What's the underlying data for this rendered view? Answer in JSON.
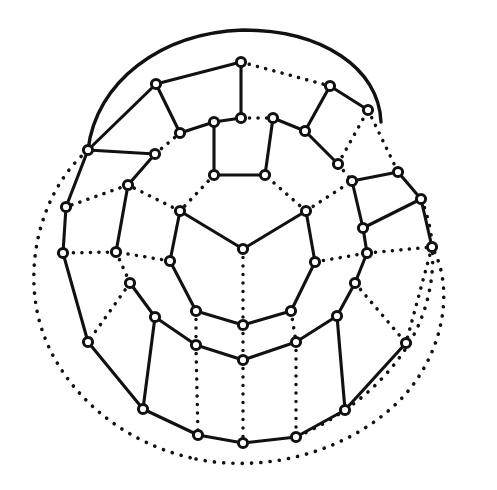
{
  "figure": {
    "type": "graph-diagram",
    "width": 497,
    "height": 490,
    "background_color": "#ffffff",
    "ink_color": "#111111",
    "node_radius": 4.6,
    "node_count": 45,
    "solid_edge_count": 47,
    "dotted_edge_count": 29
  },
  "nodes": [
    {
      "id": "c0",
      "ring": 0,
      "x": 243,
      "y": 249
    },
    {
      "id": "r1a",
      "ring": 1,
      "x": 180,
      "y": 211
    },
    {
      "id": "r1b",
      "ring": 1,
      "x": 170,
      "y": 261
    },
    {
      "id": "r1c",
      "ring": 1,
      "x": 196,
      "y": 311
    },
    {
      "id": "r1d",
      "ring": 1,
      "x": 243,
      "y": 325
    },
    {
      "id": "r1e",
      "ring": 1,
      "x": 291,
      "y": 311
    },
    {
      "id": "r1f",
      "ring": 1,
      "x": 315,
      "y": 262
    },
    {
      "id": "r1g",
      "ring": 1,
      "x": 306,
      "y": 211
    },
    {
      "id": "r1h",
      "ring": 1,
      "x": 265,
      "y": 175
    },
    {
      "id": "r1i",
      "ring": 1,
      "x": 214,
      "y": 175
    },
    {
      "id": "r2a",
      "ring": 2,
      "x": 214,
      "y": 122
    },
    {
      "id": "r2b",
      "ring": 2,
      "x": 241,
      "y": 118
    },
    {
      "id": "r2c",
      "ring": 2,
      "x": 273,
      "y": 118
    },
    {
      "id": "r2d",
      "ring": 2,
      "x": 305,
      "y": 131
    },
    {
      "id": "r2e",
      "ring": 2,
      "x": 338,
      "y": 164
    },
    {
      "id": "r2f",
      "ring": 2,
      "x": 352,
      "y": 181
    },
    {
      "id": "r2g",
      "ring": 2,
      "x": 363,
      "y": 228
    },
    {
      "id": "r2h",
      "ring": 2,
      "x": 367,
      "y": 253
    },
    {
      "id": "r2i",
      "ring": 2,
      "x": 355,
      "y": 283
    },
    {
      "id": "r2j",
      "ring": 2,
      "x": 337,
      "y": 316
    },
    {
      "id": "r2k",
      "ring": 2,
      "x": 296,
      "y": 342
    },
    {
      "id": "r2l",
      "ring": 2,
      "x": 243,
      "y": 360
    },
    {
      "id": "r2m",
      "ring": 2,
      "x": 196,
      "y": 345
    },
    {
      "id": "r2n",
      "ring": 2,
      "x": 155,
      "y": 317
    },
    {
      "id": "r2o",
      "ring": 2,
      "x": 130,
      "y": 283
    },
    {
      "id": "r2p",
      "ring": 2,
      "x": 116,
      "y": 252
    },
    {
      "id": "r2q",
      "ring": 2,
      "x": 128,
      "y": 185
    },
    {
      "id": "r2r",
      "ring": 2,
      "x": 155,
      "y": 154
    },
    {
      "id": "r2s",
      "ring": 2,
      "x": 180,
      "y": 133
    },
    {
      "id": "r3a",
      "ring": 3,
      "x": 156,
      "y": 84
    },
    {
      "id": "r3b",
      "ring": 3,
      "x": 241,
      "y": 62
    },
    {
      "id": "r3c",
      "ring": 3,
      "x": 330,
      "y": 86
    },
    {
      "id": "r3d",
      "ring": 3,
      "x": 368,
      "y": 110
    },
    {
      "id": "r3e",
      "ring": 3,
      "x": 398,
      "y": 172
    },
    {
      "id": "r3f",
      "ring": 3,
      "x": 421,
      "y": 199
    },
    {
      "id": "r3g",
      "ring": 3,
      "x": 432,
      "y": 247
    },
    {
      "id": "r3h",
      "ring": 3,
      "x": 406,
      "y": 343
    },
    {
      "id": "r3i",
      "ring": 3,
      "x": 345,
      "y": 410
    },
    {
      "id": "r3j",
      "ring": 3,
      "x": 296,
      "y": 437
    },
    {
      "id": "r3k",
      "ring": 3,
      "x": 243,
      "y": 443
    },
    {
      "id": "r3l",
      "ring": 3,
      "x": 198,
      "y": 435
    },
    {
      "id": "r3m",
      "ring": 3,
      "x": 143,
      "y": 409
    },
    {
      "id": "r3n",
      "ring": 3,
      "x": 88,
      "y": 342
    },
    {
      "id": "r3o",
      "ring": 3,
      "x": 63,
      "y": 253
    },
    {
      "id": "r3p",
      "ring": 3,
      "x": 66,
      "y": 207
    },
    {
      "id": "r3q",
      "ring": 3,
      "x": 88,
      "y": 150
    }
  ],
  "edges": [
    {
      "from": "c0",
      "to": "r1a",
      "style": "solid"
    },
    {
      "from": "c0",
      "to": "r1g",
      "style": "solid"
    },
    {
      "from": "c0",
      "to": "r1d",
      "style": "dotted"
    },
    {
      "from": "r1a",
      "to": "r1b",
      "style": "solid"
    },
    {
      "from": "r1b",
      "to": "r1c",
      "style": "solid"
    },
    {
      "from": "r1c",
      "to": "r1d",
      "style": "solid"
    },
    {
      "from": "r1d",
      "to": "r1e",
      "style": "solid"
    },
    {
      "from": "r1e",
      "to": "r1f",
      "style": "solid"
    },
    {
      "from": "r1f",
      "to": "r1g",
      "style": "solid"
    },
    {
      "from": "r1g",
      "to": "r1h",
      "style": "dotted"
    },
    {
      "from": "r1h",
      "to": "r1i",
      "style": "solid"
    },
    {
      "from": "r1i",
      "to": "r1a",
      "style": "dotted"
    },
    {
      "from": "r1i",
      "to": "r2a",
      "style": "solid"
    },
    {
      "from": "r1h",
      "to": "r2c",
      "style": "solid"
    },
    {
      "from": "r1b",
      "to": "r2p",
      "style": "dotted"
    },
    {
      "from": "r1c",
      "to": "r2m",
      "style": "dotted"
    },
    {
      "from": "r1e",
      "to": "r2k",
      "style": "dotted"
    },
    {
      "from": "r1f",
      "to": "r2h",
      "style": "dotted"
    },
    {
      "from": "r1a",
      "to": "r2q",
      "style": "dotted"
    },
    {
      "from": "r1g",
      "to": "r2f",
      "style": "dotted"
    },
    {
      "from": "r1d",
      "to": "r2l",
      "style": "dotted"
    },
    {
      "from": "r2a",
      "to": "r2b",
      "style": "solid"
    },
    {
      "from": "r2b",
      "to": "r2c",
      "style": "dotted"
    },
    {
      "from": "r2c",
      "to": "r2d",
      "style": "solid"
    },
    {
      "from": "r2d",
      "to": "r2e",
      "style": "solid"
    },
    {
      "from": "r2e",
      "to": "r2f",
      "style": "dotted"
    },
    {
      "from": "r2f",
      "to": "r2g",
      "style": "solid"
    },
    {
      "from": "r2g",
      "to": "r2h",
      "style": "solid"
    },
    {
      "from": "r2h",
      "to": "r2i",
      "style": "solid"
    },
    {
      "from": "r2i",
      "to": "r2j",
      "style": "solid"
    },
    {
      "from": "r2j",
      "to": "r2k",
      "style": "solid"
    },
    {
      "from": "r2k",
      "to": "r2l",
      "style": "solid"
    },
    {
      "from": "r2l",
      "to": "r2m",
      "style": "solid"
    },
    {
      "from": "r2m",
      "to": "r2n",
      "style": "solid"
    },
    {
      "from": "r2n",
      "to": "r2o",
      "style": "solid"
    },
    {
      "from": "r2o",
      "to": "r2p",
      "style": "dotted"
    },
    {
      "from": "r2p",
      "to": "r2q",
      "style": "solid"
    },
    {
      "from": "r2q",
      "to": "r2r",
      "style": "solid"
    },
    {
      "from": "r2r",
      "to": "r2s",
      "style": "dotted"
    },
    {
      "from": "r2s",
      "to": "r2a",
      "style": "solid"
    },
    {
      "from": "r2s",
      "to": "r3a",
      "style": "solid"
    },
    {
      "from": "r2b",
      "to": "r3b",
      "style": "solid"
    },
    {
      "from": "r2d",
      "to": "r3c",
      "style": "solid"
    },
    {
      "from": "r2e",
      "to": "r3d",
      "style": "dotted"
    },
    {
      "from": "r2f",
      "to": "r3e",
      "style": "solid"
    },
    {
      "from": "r2g",
      "to": "r3f",
      "style": "solid"
    },
    {
      "from": "r2h",
      "to": "r3g",
      "style": "dotted"
    },
    {
      "from": "r2i",
      "to": "r3h",
      "style": "dotted"
    },
    {
      "from": "r2j",
      "to": "r3i",
      "style": "solid"
    },
    {
      "from": "r2k",
      "to": "r3j",
      "style": "dotted"
    },
    {
      "from": "r2l",
      "to": "r3k",
      "style": "dotted"
    },
    {
      "from": "r2m",
      "to": "r3l",
      "style": "dotted"
    },
    {
      "from": "r2n",
      "to": "r3m",
      "style": "solid"
    },
    {
      "from": "r2o",
      "to": "r3n",
      "style": "dotted"
    },
    {
      "from": "r2p",
      "to": "r3o",
      "style": "dotted"
    },
    {
      "from": "r2q",
      "to": "r3p",
      "style": "dotted"
    },
    {
      "from": "r2r",
      "to": "r3q",
      "style": "solid"
    },
    {
      "from": "r3a",
      "to": "r3b",
      "style": "solid"
    },
    {
      "from": "r3b",
      "to": "r3c",
      "style": "dotted"
    },
    {
      "from": "r3c",
      "to": "r3d",
      "style": "solid"
    },
    {
      "from": "r3d",
      "to": "r3e",
      "style": "dotted"
    },
    {
      "from": "r3e",
      "to": "r3f",
      "style": "solid"
    },
    {
      "from": "r3f",
      "to": "r3g",
      "style": "solid"
    },
    {
      "from": "r3g",
      "to": "r3h",
      "style": "dotted"
    },
    {
      "from": "r3h",
      "to": "r3i",
      "style": "solid"
    },
    {
      "from": "r3i",
      "to": "r3j",
      "style": "solid"
    },
    {
      "from": "r3j",
      "to": "r3k",
      "style": "solid"
    },
    {
      "from": "r3k",
      "to": "r3l",
      "style": "solid"
    },
    {
      "from": "r3l",
      "to": "r3m",
      "style": "solid"
    },
    {
      "from": "r3m",
      "to": "r3n",
      "style": "solid"
    },
    {
      "from": "r3n",
      "to": "r3o",
      "style": "solid"
    },
    {
      "from": "r3o",
      "to": "r3p",
      "style": "solid"
    },
    {
      "from": "r3p",
      "to": "r3q",
      "style": "solid"
    },
    {
      "from": "r3q",
      "to": "r3a",
      "style": "solid"
    }
  ],
  "arcs": [
    {
      "id": "outer-top-solid-arc",
      "style": "solid",
      "path": "M 88 150 C 96 82 160 33 243 30 C 322 30 379 68 381 122",
      "note": "Solid wrap-around arc sweeping over the top of the drawing, from the upper-left ring vertex to the upper-right."
    },
    {
      "id": "outer-left-dotted-arc",
      "style": "dotted",
      "path": "M 88 150 C 46 186 27 250 36 305 C 46 372 106 440 196 459",
      "note": "Long dotted wrap-around arc outside the outer ring on the left and lower-left."
    },
    {
      "id": "outer-bottom-right-dotted-arc",
      "style": "dotted",
      "path": "M 196 459 C 270 474 352 450 402 398 C 444 353 455 288 432 247",
      "note": "Dotted wrap-around arc closing the outer boundary along the bottom-right."
    },
    {
      "id": "outer-right-inner-dotted-arc",
      "style": "dotted",
      "path": "M 421 199 C 440 243 436 300 408 345 C 380 390 336 420 296 437",
      "note": "Second, inner dotted arc on the right side running parallel to the outer boundary."
    }
  ],
  "legend": {
    "solid_edge_label": "solid edge",
    "dotted_edge_label": "dotted edge",
    "vertex_label": "vertex"
  }
}
